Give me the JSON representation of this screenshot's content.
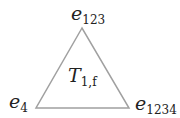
{
  "diagram": {
    "type": "triangle",
    "stroke_color": "#a0a0a0",
    "vertices": [
      {
        "id": "top",
        "label_base": "e",
        "label_sub": "123",
        "x": 82,
        "y": 28
      },
      {
        "id": "bottom-left",
        "label_base": "e",
        "label_sub": "4",
        "x": 36,
        "y": 108
      },
      {
        "id": "bottom-right",
        "label_base": "e",
        "label_sub": "1234",
        "x": 129,
        "y": 108
      }
    ],
    "face_label": {
      "base": "T",
      "sub": "1,f"
    }
  }
}
